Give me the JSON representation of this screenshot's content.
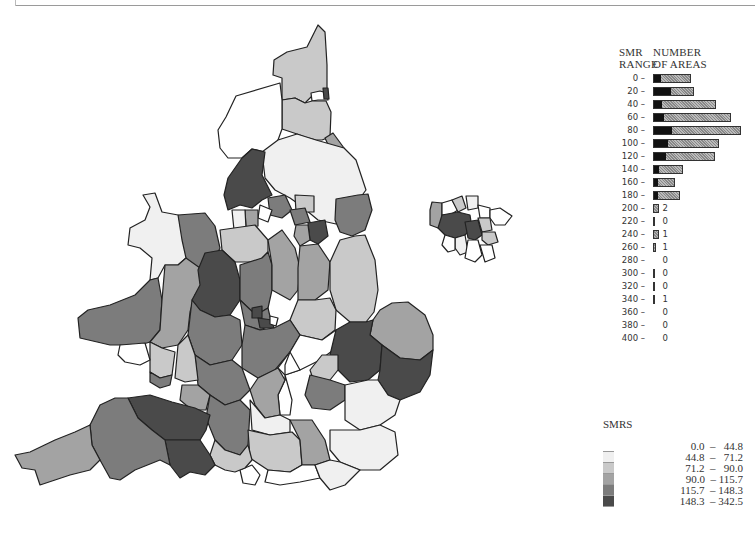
{
  "chart_data": {
    "type": "bar",
    "histogram": {
      "xlabel": "NUMBER OF AREAS",
      "ylabel": "SMR RANGE",
      "header_left": [
        "SMR",
        "RANGE"
      ],
      "header_right": [
        "NUMBER",
        "OF AREAS"
      ],
      "categories": [
        "0 –",
        "20 –",
        "40 –",
        "60 –",
        "80 –",
        "100 –",
        "120 –",
        "140 –",
        "160 –",
        "180 –",
        "200 –",
        "220 –",
        "240 –",
        "260 –",
        "280 –",
        "300 –",
        "320 –",
        "340 –",
        "360 –",
        "380 –",
        "400 –"
      ],
      "values": [
        6,
        15,
        8,
        10,
        16,
        13,
        12,
        5,
        4,
        4,
        2,
        0,
        1,
        1,
        0,
        0,
        0,
        1,
        0,
        0,
        0
      ],
      "bar_total_px": [
        38,
        41,
        63,
        78,
        88,
        66,
        62,
        30,
        22,
        27,
        6,
        2,
        6,
        3,
        0,
        2,
        1,
        1,
        0,
        0,
        0
      ],
      "bar_dark_px": [
        7,
        17,
        8,
        10,
        18,
        14,
        12,
        5,
        4,
        4,
        0,
        0,
        0,
        0,
        0,
        0,
        0,
        0,
        0,
        0,
        0
      ]
    },
    "legend": {
      "title": "SMRS",
      "classes": [
        {
          "label": "0.0  –   44.8",
          "color": "#ffffff"
        },
        {
          "label": "44.8  –   71.2",
          "color": "#f0f0f0"
        },
        {
          "label": "71.2  –   90.0",
          "color": "#c9c9c9"
        },
        {
          "label": "90.0  – 115.7",
          "color": "#a3a3a3"
        },
        {
          "label": "115.7  – 148.3",
          "color": "#7c7c7c"
        },
        {
          "label": "148.3  – 342.5",
          "color": "#4a4a4a"
        }
      ]
    },
    "map": {
      "type": "choropleth",
      "regions": "England and Wales health areas with Greater London inset"
    }
  }
}
